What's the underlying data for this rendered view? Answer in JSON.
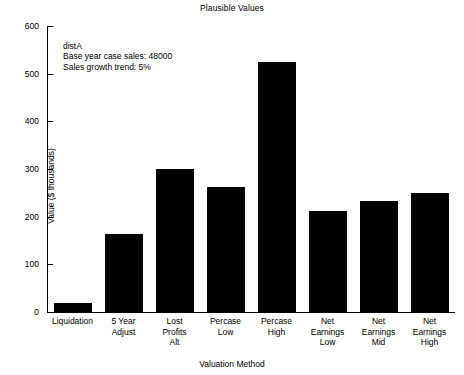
{
  "chart_data": {
    "type": "bar",
    "title": "Plausible Values",
    "xlabel": "Valuation Method",
    "ylabel": "Value ($ thousands)",
    "categories": [
      "Liquidation",
      "5 Year\nAdjust",
      "Lost\nProfits\nAlt",
      "Percase\nLow",
      "Percase\nHigh",
      "Net\nEarnings\nLow",
      "Net\nEarnings\nMid",
      "Net\nEarnings\nHigh"
    ],
    "values": [
      18,
      163,
      300,
      262,
      525,
      212,
      233,
      250
    ],
    "ylim": [
      0,
      600
    ],
    "yticks": [
      0,
      100,
      200,
      300,
      400,
      500,
      600
    ],
    "ytick_labels": [
      "0",
      "100",
      "200",
      "300",
      "400",
      "500",
      "600"
    ],
    "grid": false,
    "legend": null,
    "bar_color": "#000000",
    "background_color": "#ffffff",
    "annotations": [
      "distA",
      "Base year case sales: 48000",
      "Sales growth trend: 5%"
    ]
  }
}
